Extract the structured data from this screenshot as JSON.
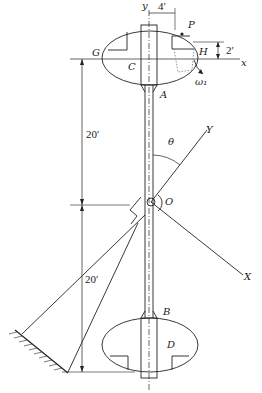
{
  "diagram": {
    "type": "mechanical-figure",
    "labels": {
      "y_top": "y",
      "x_axis": "x",
      "G": "G",
      "C": "C",
      "P": "P",
      "H": "H",
      "A": "A",
      "B": "B",
      "D": "D",
      "O": "O",
      "Y": "Y",
      "X": "X",
      "theta": "θ",
      "omega": "ω₁"
    },
    "dimensions": {
      "horizontal_top": "4′",
      "vertical_small": "2′",
      "upper_span": "20′",
      "lower_span": "20′"
    },
    "colors": {
      "line": "#222222",
      "dotted": "#888888",
      "background": "#ffffff"
    }
  }
}
